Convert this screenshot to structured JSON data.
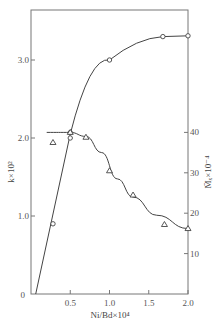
{
  "chart_data": {
    "type": "line",
    "title": "",
    "xlabel": "Ni/Bd×10⁴",
    "ylabel": "k×10²",
    "y2label": "M̄ₓ×10⁻⁴",
    "xlim": [
      0,
      2.0
    ],
    "ylim": [
      0,
      3.4
    ],
    "y2lim": [
      0,
      70
    ],
    "x_ticks": [
      "0.5",
      "1.0",
      "1.5",
      "2.0"
    ],
    "y_ticks": [
      "0",
      "1.0",
      "2.0",
      "3.0"
    ],
    "y2_ticks": [
      "10",
      "20",
      "30",
      "40"
    ],
    "grid": false,
    "legend": null,
    "series": [
      {
        "name": "k×10² (circles, left axis)",
        "marker": "circle",
        "axis": "left",
        "points": [
          [
            0.28,
            0.9
          ],
          [
            0.5,
            2.07
          ],
          [
            0.5,
            2.0
          ],
          [
            1.0,
            3.0
          ],
          [
            1.68,
            3.3
          ],
          [
            2.0,
            3.31
          ]
        ],
        "curve": [
          [
            0.06,
            0.0
          ],
          [
            0.2,
            0.75
          ],
          [
            0.35,
            1.5
          ],
          [
            0.5,
            2.05
          ],
          [
            0.7,
            2.55
          ],
          [
            1.0,
            3.0
          ],
          [
            1.3,
            3.2
          ],
          [
            1.68,
            3.3
          ],
          [
            2.0,
            3.31
          ]
        ]
      },
      {
        "name": "M̄ₓ×10⁻⁴ (triangles, right axis)",
        "marker": "triangle",
        "axis": "right",
        "points": [
          [
            0.28,
            37.5
          ],
          [
            0.5,
            40
          ],
          [
            0.7,
            38.8
          ],
          [
            1.0,
            30.5
          ],
          [
            1.3,
            24.5
          ],
          [
            1.7,
            17.2
          ],
          [
            2.0,
            16.2
          ]
        ],
        "curve": [
          [
            0.2,
            40
          ],
          [
            0.5,
            40
          ],
          [
            0.7,
            39
          ],
          [
            0.9,
            35
          ],
          [
            1.1,
            28.5
          ],
          [
            1.3,
            24
          ],
          [
            1.6,
            19.5
          ],
          [
            2.0,
            16.2
          ]
        ]
      }
    ],
    "origin_label": "0"
  }
}
